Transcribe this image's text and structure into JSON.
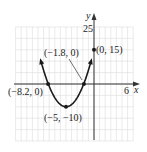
{
  "chart_data": {
    "type": "line",
    "title": "",
    "xlabel": "x",
    "ylabel": "y",
    "function": "y = x^2 + 10x + 15",
    "xlim": [
      -14,
      7
    ],
    "ylim": [
      -25,
      25
    ],
    "grid": true,
    "x_tick_labels": [
      "6"
    ],
    "y_tick_labels": [
      "25"
    ],
    "points": [
      {
        "x": -8.2,
        "y": 0,
        "label": "(-8.2, 0)"
      },
      {
        "x": -5,
        "y": -10,
        "label": "(-5, -10)"
      },
      {
        "x": -1.8,
        "y": 0,
        "label": "(-1.8, 0)"
      },
      {
        "x": 0,
        "y": 15,
        "label": "(0, 15)"
      }
    ]
  },
  "labels": {
    "x_axis": "x",
    "y_axis": "y",
    "x_tick": "6",
    "y_tick": "25",
    "p1": "(−8.2, 0)",
    "p2": "(−5, −10)",
    "p3": "(−1.8, 0)",
    "p4": "(0, 15)"
  },
  "colors": {
    "curve": "#1a1a1a",
    "grid": "#d9d9d9",
    "axis": "#333333"
  }
}
